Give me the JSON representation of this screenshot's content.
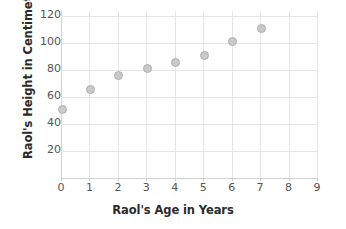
{
  "chart_data": {
    "type": "scatter",
    "title": "",
    "xlabel": "Raol's Age in Years",
    "ylabel": "Raol's Height in Centimeters",
    "x": [
      0,
      1,
      2,
      3,
      4,
      5,
      6,
      7
    ],
    "values": [
      51,
      66,
      76,
      81,
      86,
      91,
      101,
      111
    ],
    "points": [
      {
        "x": 0,
        "y": 51
      },
      {
        "x": 1,
        "y": 66
      },
      {
        "x": 2,
        "y": 76
      },
      {
        "x": 3,
        "y": 81
      },
      {
        "x": 4,
        "y": 86
      },
      {
        "x": 5,
        "y": 91
      },
      {
        "x": 6,
        "y": 101
      },
      {
        "x": 7,
        "y": 111
      }
    ],
    "xlim": [
      0,
      9
    ],
    "ylim": [
      0,
      124
    ],
    "xticks": [
      "0",
      "1",
      "2",
      "3",
      "4",
      "5",
      "6",
      "7",
      "8",
      "9"
    ],
    "yticks": [
      "120",
      "100",
      "80",
      "60",
      "40",
      "20"
    ],
    "ytick_values": [
      120,
      100,
      80,
      60,
      40,
      20
    ],
    "grid": true,
    "legend": null,
    "marker_color": "#c9c9c9",
    "marker_edge_color": "#b0b0b0",
    "grid_color": "#e6e6e6",
    "axis_color": "#d2d2d2",
    "label_color": "#2b2b2b",
    "tick_color": "#555555"
  }
}
